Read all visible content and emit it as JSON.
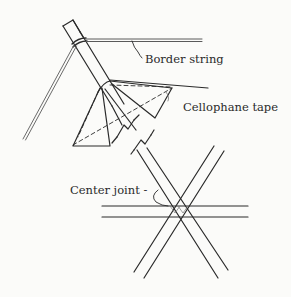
{
  "figure": {
    "labels": {
      "border_string": "Border string",
      "cellophane_tape": "Cellophane tape",
      "center_joint": "Center joint -"
    },
    "colors": {
      "line": "#2a2a2a",
      "string": "#5a5a5a",
      "background": "#fbfbf9"
    }
  }
}
